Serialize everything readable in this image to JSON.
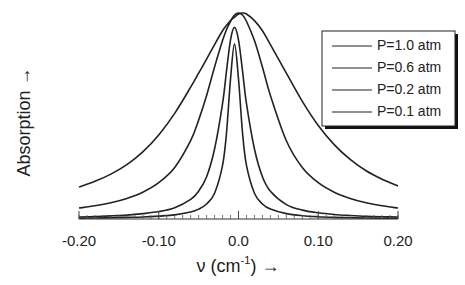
{
  "chart_data": {
    "type": "line",
    "title": "",
    "xlabel": "ν (cm⁻¹) →",
    "xlabel_base": "ν (cm",
    "xlabel_sup": "-1",
    "xlabel_tail": ") →",
    "ylabel": "Absorption →",
    "xlim": [
      -0.2,
      0.2
    ],
    "ylim": [
      0,
      1.0
    ],
    "grid": false,
    "legend_position": "top-right",
    "x_ticks": [
      {
        "value": -0.2,
        "label": "-0.20"
      },
      {
        "value": -0.1,
        "label": "-0.10"
      },
      {
        "value": 0.0,
        "label": "0.0"
      },
      {
        "value": 0.1,
        "label": "0.10"
      },
      {
        "value": 0.2,
        "label": "0.20"
      }
    ],
    "minor_tick_step": 0.01,
    "x": [
      -0.2,
      -0.18,
      -0.16,
      -0.14,
      -0.12,
      -0.1,
      -0.08,
      -0.06,
      -0.05,
      -0.04,
      -0.03,
      -0.02,
      -0.015,
      -0.01,
      -0.005,
      0.0,
      0.005,
      0.01,
      0.02,
      0.03,
      0.04,
      0.06,
      0.08,
      0.1,
      0.12,
      0.14,
      0.16,
      0.18,
      0.2
    ],
    "series": [
      {
        "name": "P=1.0 atm",
        "values": [
          0.155,
          0.183,
          0.218,
          0.264,
          0.326,
          0.408,
          0.513,
          0.64,
          0.708,
          0.776,
          0.847,
          0.914,
          0.94,
          0.963,
          0.98,
          0.995,
          1.0,
          0.995,
          0.963,
          0.914,
          0.847,
          0.708,
          0.571,
          0.454,
          0.361,
          0.289,
          0.234,
          0.193,
          0.16
        ]
      },
      {
        "name": "P=0.6 atm",
        "values": [
          0.053,
          0.064,
          0.079,
          0.1,
          0.13,
          0.176,
          0.25,
          0.38,
          0.48,
          0.6,
          0.738,
          0.866,
          0.92,
          0.96,
          0.99,
          1.0,
          0.99,
          0.96,
          0.866,
          0.738,
          0.6,
          0.38,
          0.25,
          0.176,
          0.13,
          0.1,
          0.079,
          0.064,
          0.053
        ]
      },
      {
        "name": "P=0.2 atm",
        "values": [
          0.01,
          0.012,
          0.015,
          0.019,
          0.026,
          0.036,
          0.055,
          0.095,
          0.135,
          0.205,
          0.34,
          0.56,
          0.72,
          0.87,
          0.93,
          0.87,
          0.72,
          0.56,
          0.34,
          0.205,
          0.135,
          0.07,
          0.043,
          0.03,
          0.022,
          0.017,
          0.013,
          0.011,
          0.01
        ]
      },
      {
        "name": "P=0.1 atm",
        "values": [
          0.004,
          0.005,
          0.006,
          0.008,
          0.01,
          0.014,
          0.02,
          0.034,
          0.048,
          0.073,
          0.125,
          0.26,
          0.42,
          0.68,
          0.85,
          0.68,
          0.42,
          0.26,
          0.125,
          0.073,
          0.048,
          0.026,
          0.016,
          0.011,
          0.008,
          0.006,
          0.005,
          0.004,
          0.004
        ]
      }
    ]
  }
}
